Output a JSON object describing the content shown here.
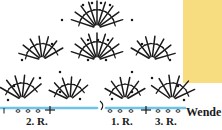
{
  "figure": {
    "type": "crochet-stitch-diagram",
    "background": "#ffffff",
    "stitch_color": "#1a1a1a",
    "chain_row_color": "#6fc3e8",
    "swatch_color": "#f7dd80"
  },
  "labels": {
    "row2": "2. R.",
    "row1": "1. R.",
    "row3": "3. R.",
    "turn": "Wende"
  },
  "swatch": {
    "name": "yarn-color-swatch",
    "color": "#f7dd80",
    "x": 183,
    "y": 0,
    "width": 39,
    "height": 83
  },
  "chart_data": {
    "type": "diagram",
    "title": "",
    "chain_rows": [
      {
        "name": "row-1-chain",
        "y": 108,
        "x1": 106,
        "x2": 185,
        "color": "#6fc3e8"
      },
      {
        "name": "row-2-chain",
        "y": 108,
        "x1": 0,
        "x2": 97,
        "color": "#6fc3e8"
      }
    ],
    "turning_chain": {
      "name": "turning-chain-loop",
      "x": 100,
      "y": 101
    },
    "base_marks": [
      {
        "type": "tick",
        "x": 4,
        "y": 111
      },
      {
        "type": "oval",
        "x": 18,
        "y": 111
      },
      {
        "type": "oval",
        "x": 28,
        "y": 111
      },
      {
        "type": "oval",
        "x": 38,
        "y": 111
      },
      {
        "type": "plus",
        "x": 50,
        "y": 110
      },
      {
        "type": "oval",
        "x": 110,
        "y": 111
      },
      {
        "type": "oval",
        "x": 120,
        "y": 111
      },
      {
        "type": "oval",
        "x": 131,
        "y": 111
      },
      {
        "type": "plus",
        "x": 146,
        "y": 110
      },
      {
        "type": "oval",
        "x": 158,
        "y": 111
      },
      {
        "type": "oval",
        "x": 168,
        "y": 111
      },
      {
        "type": "oval",
        "x": 178,
        "y": 111
      }
    ],
    "fans": [
      {
        "name": "fan-top-center",
        "cx": 97,
        "cy": 28,
        "r": 27,
        "spokes": 9,
        "a0": 198,
        "a1": 342
      },
      {
        "name": "fan-mid-left",
        "cx": 42,
        "cy": 60,
        "r": 24,
        "spokes": 7,
        "a0": 196,
        "a1": 330
      },
      {
        "name": "fan-mid-center",
        "cx": 97,
        "cy": 60,
        "r": 27,
        "spokes": 9,
        "a0": 198,
        "a1": 342
      },
      {
        "name": "fan-mid-right",
        "cx": 152,
        "cy": 60,
        "r": 24,
        "spokes": 7,
        "a0": 210,
        "a1": 344
      },
      {
        "name": "fan-low-left",
        "cx": 22,
        "cy": 100,
        "r": 25,
        "spokes": 6,
        "a0": 210,
        "a1": 320
      },
      {
        "name": "fan-low-cl",
        "cx": 70,
        "cy": 100,
        "r": 23,
        "spokes": 6,
        "a0": 205,
        "a1": 320
      },
      {
        "name": "fan-low-cr",
        "cx": 125,
        "cy": 100,
        "r": 23,
        "spokes": 6,
        "a0": 210,
        "a1": 330
      },
      {
        "name": "fan-low-right",
        "cx": 172,
        "cy": 100,
        "r": 25,
        "spokes": 6,
        "a0": 215,
        "a1": 335
      }
    ],
    "picot_dots": [
      {
        "x": 83,
        "y": 5
      },
      {
        "x": 92,
        "y": 3
      },
      {
        "x": 101,
        "y": 3
      },
      {
        "x": 110,
        "y": 5
      },
      {
        "x": 62,
        "y": 20
      },
      {
        "x": 132,
        "y": 20
      },
      {
        "x": 88,
        "y": 40
      },
      {
        "x": 98,
        "y": 40
      },
      {
        "x": 108,
        "y": 40
      },
      {
        "x": 52,
        "y": 44
      },
      {
        "x": 142,
        "y": 44
      },
      {
        "x": 22,
        "y": 60
      },
      {
        "x": 170,
        "y": 60
      },
      {
        "x": 88,
        "y": 60
      },
      {
        "x": 106,
        "y": 60
      },
      {
        "x": 60,
        "y": 72
      },
      {
        "x": 132,
        "y": 72
      },
      {
        "x": 40,
        "y": 78
      },
      {
        "x": 152,
        "y": 78
      },
      {
        "x": 14,
        "y": 86
      },
      {
        "x": 178,
        "y": 86
      },
      {
        "x": 60,
        "y": 92
      },
      {
        "x": 132,
        "y": 92
      },
      {
        "x": 80,
        "y": 99
      },
      {
        "x": 112,
        "y": 99
      },
      {
        "x": 8,
        "y": 100
      },
      {
        "x": 184,
        "y": 100
      }
    ]
  }
}
